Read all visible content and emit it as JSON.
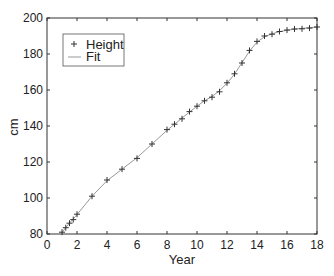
{
  "chart_data": {
    "type": "line",
    "title": "",
    "xlabel": "Year",
    "ylabel": "cm",
    "xlim": [
      0,
      18
    ],
    "ylim": [
      80,
      200
    ],
    "xticks": [
      0,
      2,
      4,
      6,
      8,
      10,
      12,
      14,
      16,
      18
    ],
    "yticks": [
      80,
      100,
      120,
      140,
      160,
      180,
      200
    ],
    "grid": false,
    "legend_position": "upper left",
    "legend": [
      "Height",
      "Fit"
    ],
    "series": [
      {
        "name": "Height",
        "style": "markers",
        "marker": "+",
        "color": "#333333",
        "x": [
          1,
          1.25,
          1.5,
          1.75,
          2,
          3,
          4,
          5,
          6,
          7,
          8,
          8.5,
          9,
          9.5,
          10,
          10.5,
          11,
          11.5,
          12,
          12.5,
          13,
          13.5,
          14,
          14.5,
          15,
          15.5,
          16,
          16.5,
          17,
          17.5,
          18
        ],
        "y": [
          81,
          83.5,
          86,
          88,
          91,
          101,
          110,
          116,
          122,
          130,
          138,
          141,
          144,
          148,
          151,
          154,
          156,
          159,
          164,
          169,
          175,
          182,
          187,
          190,
          191,
          192.5,
          193.3,
          193.9,
          194,
          194.4,
          195
        ]
      },
      {
        "name": "Fit",
        "style": "line",
        "color": "#999999",
        "x": [
          1,
          1.25,
          1.5,
          1.75,
          2,
          3,
          4,
          5,
          6,
          7,
          8,
          8.5,
          9,
          9.5,
          10,
          10.5,
          11,
          11.5,
          12,
          12.5,
          13,
          13.5,
          14,
          14.5,
          15,
          15.5,
          16,
          16.5,
          17,
          17.5,
          18
        ],
        "y": [
          80.8,
          83.6,
          86,
          88.4,
          90.8,
          101,
          109.6,
          116,
          122.4,
          130,
          137.6,
          141,
          144.4,
          147.8,
          151,
          154,
          156.4,
          159.6,
          163.8,
          168.8,
          175.2,
          181.6,
          186.6,
          189.6,
          191.2,
          192.4,
          193.2,
          193.8,
          194.2,
          194.6,
          195
        ]
      }
    ]
  }
}
